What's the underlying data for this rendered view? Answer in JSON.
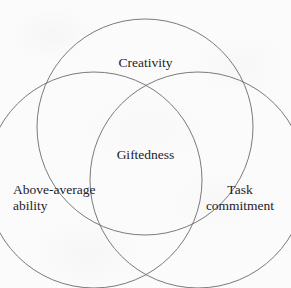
{
  "figure": {
    "type": "venn-diagram",
    "subject": "Giftedness",
    "background_color": "#fbfbfb",
    "stroke_color": "#6b6b6b",
    "text_color": "#23232a",
    "width": 291,
    "height": 288
  },
  "chart_data": {
    "type": "venn",
    "title": "",
    "sets": [
      {
        "id": "creativity",
        "label": "Creativity",
        "label_lines": [
          "Creativity"
        ],
        "cx": 145,
        "cy": 127,
        "r": 108
      },
      {
        "id": "above-average-ability",
        "label": "Above-average ability",
        "label_lines": [
          "Above-average",
          "ability"
        ],
        "cx": 94,
        "cy": 180,
        "r": 108
      },
      {
        "id": "task-commitment",
        "label": "Task commitment",
        "label_lines": [
          "Task",
          "commitment"
        ],
        "cx": 198,
        "cy": 180,
        "r": 108
      }
    ],
    "intersections": [
      {
        "id": "all-three",
        "label": "Giftedness",
        "sets": [
          "creativity",
          "above-average-ability",
          "task-commitment"
        ],
        "cx": 147,
        "cy": 155
      }
    ],
    "legend": "none",
    "grid": false
  },
  "labels": {
    "creativity": "Creativity",
    "giftedness": "Giftedness",
    "above_average_line1": "Above-average",
    "above_average_line2": "ability",
    "task_line1": "Task",
    "task_line2": "commitment"
  }
}
